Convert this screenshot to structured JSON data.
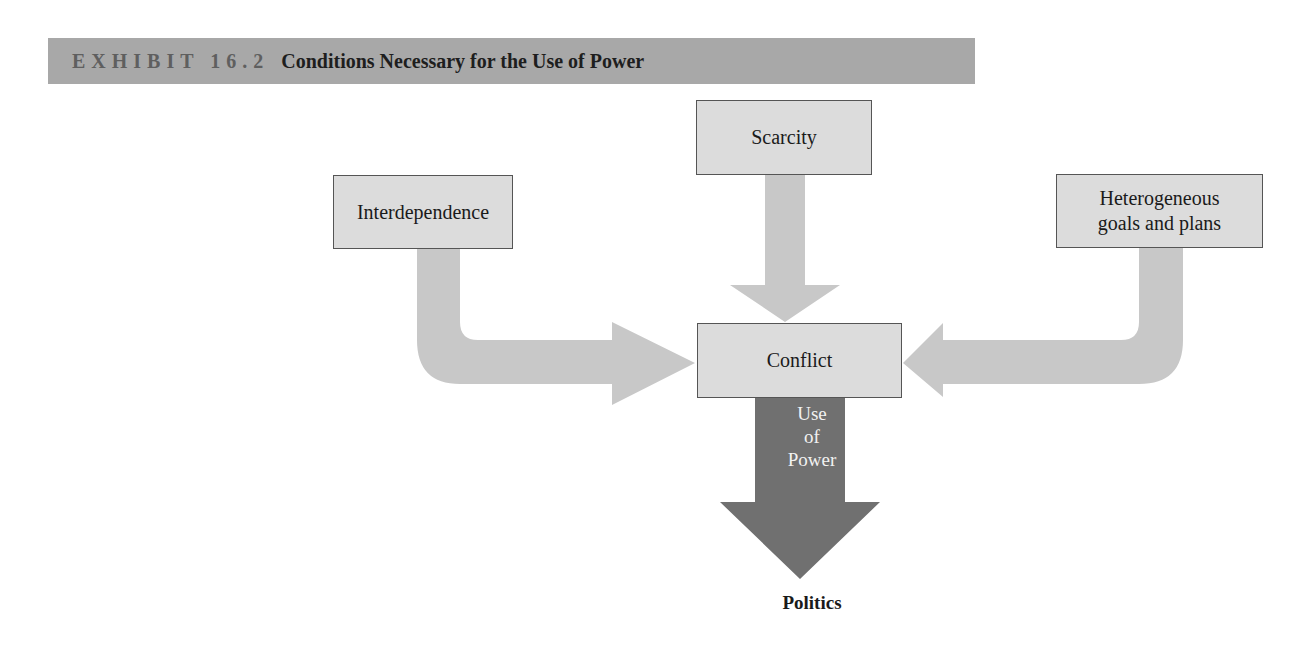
{
  "header": {
    "exhibit_label": "EXHIBIT 16.2",
    "title": "Conditions Necessary for the Use of Power"
  },
  "nodes": {
    "scarcity": "Scarcity",
    "interdependence": "Interdependence",
    "heterogeneous": "Heterogeneous goals and plans",
    "conflict": "Conflict"
  },
  "power_arrow": {
    "line1": "Use",
    "line2": "of",
    "line3": "Power"
  },
  "outcome": "Politics",
  "colors": {
    "header_bg": "#a8a8a8",
    "box_fill": "#dcdcdc",
    "light_arrow": "#c8c8c8",
    "dark_arrow": "#707070"
  },
  "edges": [
    {
      "from": "Interdependence",
      "to": "Conflict"
    },
    {
      "from": "Scarcity",
      "to": "Conflict"
    },
    {
      "from": "Heterogeneous goals and plans",
      "to": "Conflict"
    },
    {
      "from": "Conflict",
      "to": "Politics",
      "label": "Use of Power"
    }
  ]
}
